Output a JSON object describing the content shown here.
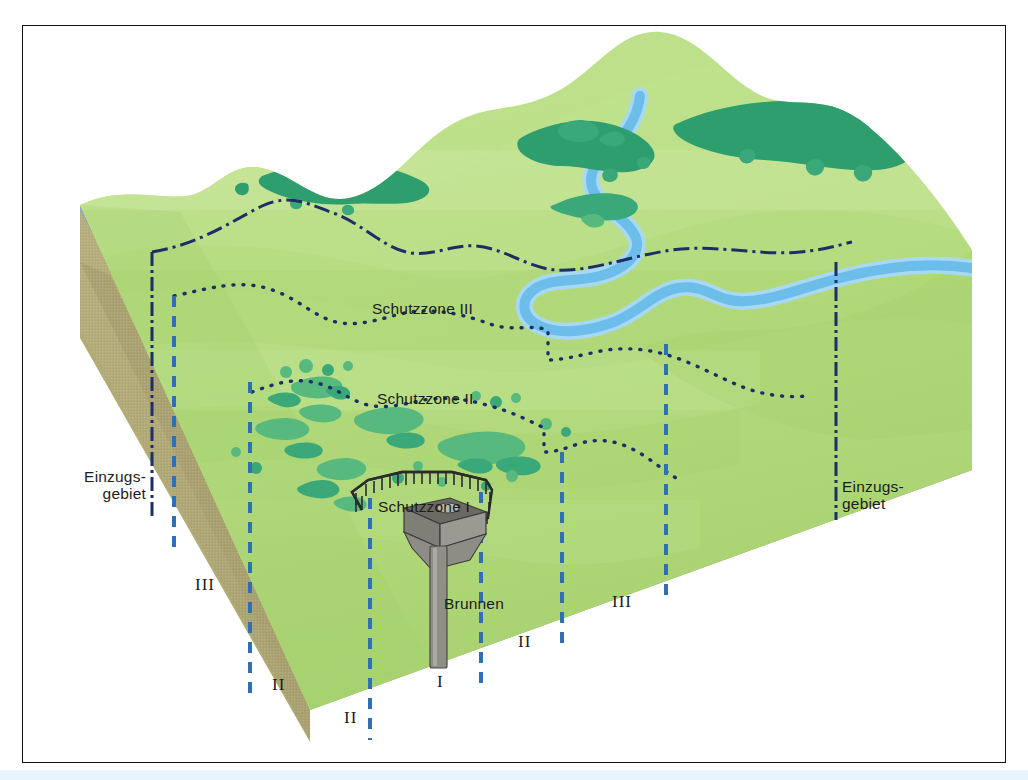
{
  "figure": {
    "language": "de",
    "border_color": "#111111"
  },
  "labels": {
    "zone3": "Schutzzone III",
    "zone2": "Schutzzone II",
    "zone1": "Schutzzone I",
    "well": "Brunnen",
    "catchment_left": "Einzugs-\ngebiet",
    "catchment_right": "Einzugs-\ngebiet",
    "marker_left_iii": "III",
    "marker_left_ii": "II",
    "marker_bottom_ii_a": "II",
    "marker_bottom_i": "I",
    "marker_bottom_ii_b": "II",
    "marker_bottom_iii": "III"
  },
  "colors": {
    "grass_light": "#b9dd86",
    "grass_mid": "#a7d473",
    "grass_pale": "#cbe6a3",
    "grass_shadow": "#9ccb6a",
    "forest_dark": "#2e9e6f",
    "forest_mid": "#3aa878",
    "shrub": "#58b97e",
    "river_blue": "#79c2ec",
    "river_edge": "#9ed4f2",
    "strata_brown": "#c79274",
    "strata_blue": "#79a3c7",
    "strata_olive": "#b3ab76",
    "boundary_navy": "#1b2f66",
    "zone_dash_blue": "#2f6fb5",
    "well_grey": "#8b8b86",
    "well_dark": "#5d5d57",
    "fence_dark": "#2b2b2b",
    "text": "#1c1c1c"
  },
  "geology": {
    "layers": [
      {
        "name": "topsoil-grass",
        "color": "#b9dd86"
      },
      {
        "name": "brown-cover-layer",
        "color": "#c79274"
      },
      {
        "name": "blue-aquifer-layer",
        "color": "#79a3c7"
      },
      {
        "name": "olive-bedrock-layer",
        "color": "#b3ab76"
      }
    ]
  },
  "features": {
    "river_name": "river",
    "well_name": "Brunnen",
    "fence_name": "Schutzzone I fence",
    "catchment_line_style": "dash-dot",
    "zone3_line_style": "dotted",
    "zone2_line_style": "dotted",
    "vertical_projection_style": "dashed"
  }
}
